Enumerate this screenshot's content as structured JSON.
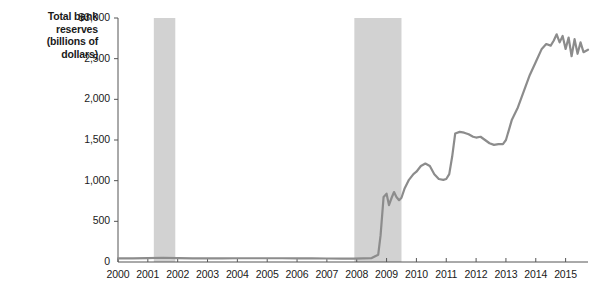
{
  "chart_data": {
    "type": "line",
    "title": "",
    "ylabel": "Total bank reserves (billions of dollars)",
    "ylabel_lines": [
      "Total bank",
      "reserves",
      "(billions of",
      "dollars)"
    ],
    "xlabel": "",
    "ylim": [
      0,
      3000
    ],
    "xlim": [
      2000,
      2015.75
    ],
    "ytick_values": [
      0,
      500,
      1000,
      1500,
      2000,
      2500,
      3000
    ],
    "ytick_labels": [
      "0",
      "500",
      "1,000",
      "1,500",
      "2,000",
      "2,500",
      "$3,000"
    ],
    "xtick_values": [
      2000,
      2001,
      2002,
      2003,
      2004,
      2005,
      2006,
      2007,
      2008,
      2009,
      2010,
      2011,
      2012,
      2013,
      2014,
      2015
    ],
    "xtick_labels": [
      "2000",
      "2001",
      "2002",
      "2003",
      "2004",
      "2005",
      "2006",
      "2007",
      "2008",
      "2009",
      "2010",
      "2011",
      "2012",
      "2013",
      "2014",
      "2015"
    ],
    "grid": false,
    "legend": null,
    "line_color": "#8c8c8c",
    "line_width": 2.2,
    "shading_color": "#d2d2d2",
    "axis_color": "#555555",
    "recession_bands": [
      {
        "start": 2001.2,
        "end": 2001.92,
        "label": "2001 recession"
      },
      {
        "start": 2007.92,
        "end": 2009.5,
        "label": "2007-2009 recession"
      }
    ],
    "series": [
      {
        "name": "Total bank reserves",
        "x": [
          2000.0,
          2000.5,
          2001.0,
          2001.5,
          2002.0,
          2002.5,
          2003.0,
          2003.5,
          2004.0,
          2004.5,
          2005.0,
          2005.5,
          2006.0,
          2006.5,
          2007.0,
          2007.5,
          2007.9,
          2008.2,
          2008.5,
          2008.72,
          2008.8,
          2008.9,
          2009.0,
          2009.08,
          2009.17,
          2009.25,
          2009.33,
          2009.42,
          2009.5,
          2009.6,
          2009.75,
          2009.9,
          2010.0,
          2010.15,
          2010.3,
          2010.45,
          2010.6,
          2010.75,
          2010.9,
          2011.0,
          2011.1,
          2011.2,
          2011.3,
          2011.45,
          2011.6,
          2011.75,
          2011.9,
          2012.0,
          2012.15,
          2012.3,
          2012.45,
          2012.6,
          2012.75,
          2012.9,
          2013.0,
          2013.2,
          2013.4,
          2013.6,
          2013.8,
          2014.0,
          2014.2,
          2014.35,
          2014.5,
          2014.6,
          2014.7,
          2014.8,
          2014.9,
          2015.0,
          2015.1,
          2015.2,
          2015.3,
          2015.4,
          2015.5,
          2015.6,
          2015.75
        ],
        "y": [
          45,
          45,
          48,
          52,
          48,
          45,
          45,
          45,
          46,
          46,
          46,
          46,
          45,
          45,
          43,
          42,
          42,
          45,
          48,
          90,
          330,
          800,
          840,
          700,
          790,
          860,
          800,
          760,
          790,
          900,
          1010,
          1080,
          1110,
          1180,
          1210,
          1180,
          1080,
          1020,
          1010,
          1020,
          1080,
          1300,
          1580,
          1600,
          1590,
          1570,
          1540,
          1530,
          1540,
          1500,
          1460,
          1440,
          1450,
          1450,
          1500,
          1750,
          1900,
          2100,
          2300,
          2460,
          2620,
          2680,
          2660,
          2720,
          2800,
          2700,
          2780,
          2620,
          2760,
          2530,
          2740,
          2560,
          2700,
          2580,
          2610
        ]
      }
    ]
  },
  "geometry": {
    "plot_left": 118,
    "plot_right": 588,
    "plot_top": 18,
    "plot_bottom": 262
  }
}
